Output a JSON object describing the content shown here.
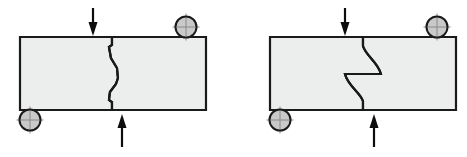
{
  "figure": {
    "background_color": "#ffffff",
    "width": 467,
    "height": 157,
    "panel_count": 2
  },
  "style": {
    "body_fill": "#eceded",
    "outline_color": "#1a1a1a",
    "roller_fill": "#c9c9c9",
    "roller_outline": "#1a1a1a",
    "roller_crosshair": "#8a8a8a",
    "arrow_color": "#0d0d0d",
    "outline_width": 2.2,
    "crack_width": 2.1
  },
  "panels": [
    {
      "id": "panel-left",
      "name": "jagged-crack-specimen",
      "crack_type": "jagged",
      "crack_description": "zigzag straight-segment crack",
      "body": {
        "x": 20,
        "y": 37,
        "width": 186,
        "height": 73
      },
      "notch_x": 112,
      "crack_segments_upper": "M112,37 L112,45 L109,47 L111,58 L117,68 L118,78",
      "crack_segments_lower": "M112,110 L112,102 L109,100 L110,92 L116,84 L118,78",
      "supports": [
        {
          "name": "roller-support-top-right",
          "position": "top-right",
          "cx": 186,
          "cy": 27,
          "r": 10.5
        },
        {
          "name": "roller-support-bottom-left",
          "position": "bottom-left",
          "cx": 30,
          "cy": 120,
          "r": 10.5
        }
      ],
      "loads": [
        {
          "name": "load-arrow-top",
          "direction": "down",
          "label": "",
          "x": 93,
          "y_start": 8,
          "y_end": 35
        },
        {
          "name": "load-arrow-bottom",
          "direction": "up",
          "label": "",
          "x": 122,
          "y_start": 147,
          "y_end": 114
        }
      ]
    },
    {
      "id": "panel-right",
      "name": "curved-crack-specimen",
      "crack_type": "curved",
      "crack_description": "smooth curvilinear crack",
      "body": {
        "x": 270,
        "y": 37,
        "width": 186,
        "height": 73
      },
      "notch_x": 363,
      "crack_segments_upper": "M363,37 L363,46 C366,56 378,62 381,74",
      "crack_segments_lower": "M363,110 L363,101 C360,92 348,86 345,74",
      "supports": [
        {
          "name": "roller-support-top-right",
          "position": "top-right",
          "cx": 437,
          "cy": 27,
          "r": 10.5
        },
        {
          "name": "roller-support-bottom-left",
          "position": "bottom-left",
          "cx": 280,
          "cy": 120,
          "r": 10.5
        }
      ],
      "loads": [
        {
          "name": "load-arrow-top",
          "direction": "down",
          "label": "",
          "x": 345,
          "y_start": 8,
          "y_end": 35
        },
        {
          "name": "load-arrow-bottom",
          "direction": "up",
          "label": "",
          "x": 374,
          "y_start": 147,
          "y_end": 114
        }
      ]
    }
  ]
}
